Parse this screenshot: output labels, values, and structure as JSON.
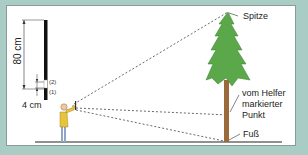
{
  "diagram": {
    "title": "",
    "labels": {
      "length_80": "80 cm",
      "length_4": "4 cm",
      "mark_1": "(1)",
      "mark_2": "(2)",
      "top": "Spitze",
      "helper_mark_line1": "vom Helfer",
      "helper_mark_line2": "markierter",
      "helper_mark_line3": "Punkt",
      "foot": "Fuß"
    },
    "colors": {
      "background_border": "#a9cdc5",
      "tree_foliage": "#5aa84a",
      "tree_trunk": "#9a6a3a",
      "person_shirt": "#e8c43a",
      "person_pants": "#8fa6c8",
      "sightlines": "#444444"
    }
  }
}
